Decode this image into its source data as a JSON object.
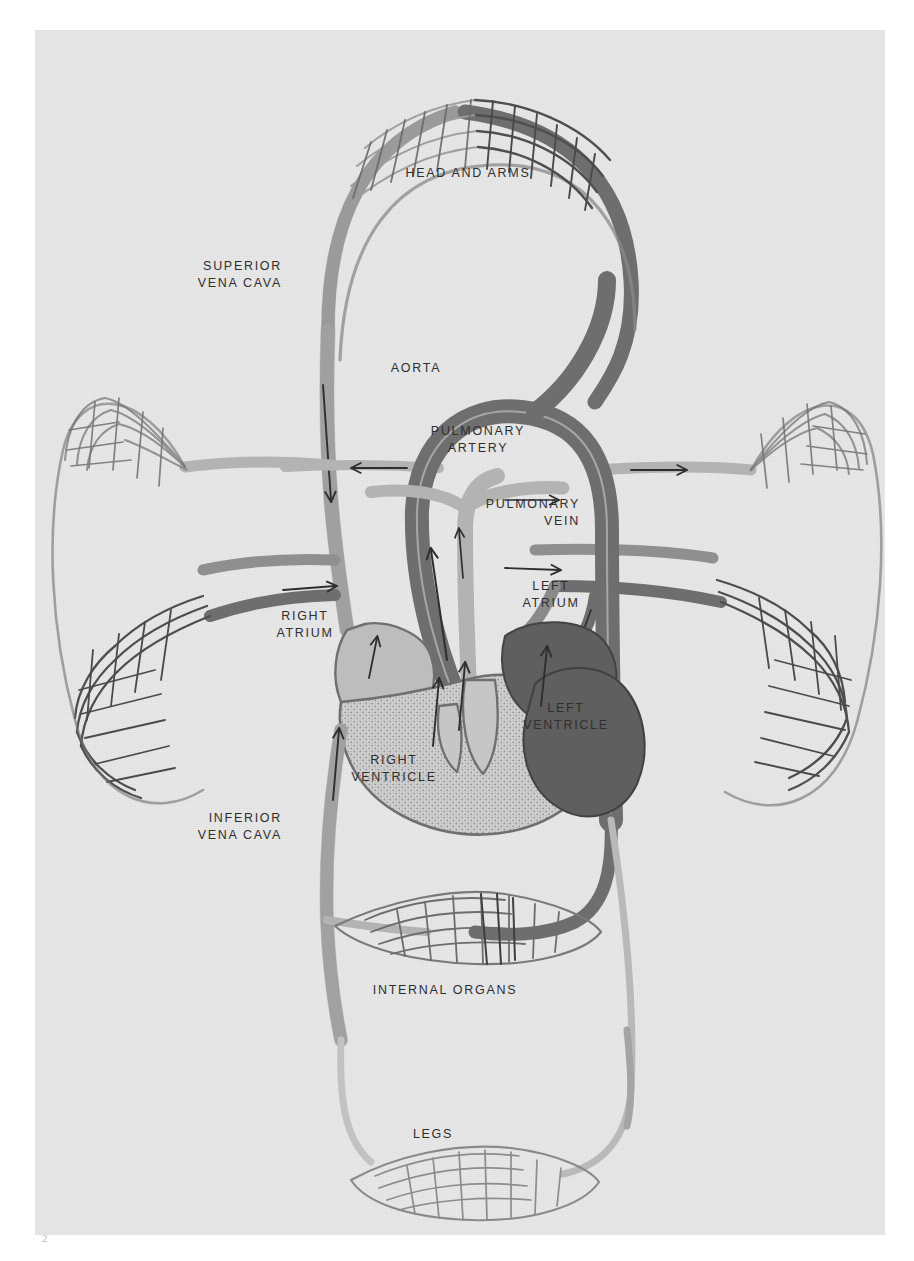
{
  "figure": {
    "page_number": "2",
    "paper_color": "#e9e9e9",
    "ink_dark": "#6b6b6b",
    "ink_light": "#b9b9b9",
    "outline_color": "#555555"
  },
  "labels": {
    "head_and_arms": "HEAD AND ARMS",
    "superior_vena_cava": "SUPERIOR\nVENA CAVA",
    "aorta": "AORTA",
    "pulmonary_artery": "PULMONARY\nARTERY",
    "pulmonary_vein": "PULMONARY\nVEIN",
    "left_atrium": "LEFT\nATRIUM",
    "right_atrium": "RIGHT\nATRIUM",
    "left_ventricle": "LEFT\nVENTRICLE",
    "right_ventricle": "RIGHT\nVENTRICLE",
    "inferior_vena_cava": "INFERIOR\nVENA CAVA",
    "internal_organs": "INTERNAL ORGANS",
    "legs": "LEGS"
  },
  "capillary_beds": [
    {
      "name": "head-and-arms",
      "label": "HEAD AND ARMS"
    },
    {
      "name": "left-lung",
      "label": ""
    },
    {
      "name": "right-lung",
      "label": ""
    },
    {
      "name": "internal-organs",
      "label": "INTERNAL ORGANS"
    },
    {
      "name": "legs",
      "label": "LEGS"
    }
  ],
  "flow_arrows": [
    {
      "name": "superior-vena-cava-down",
      "direction": "down"
    },
    {
      "name": "aorta-arch-up",
      "direction": "up"
    },
    {
      "name": "aorta-to-head-down",
      "direction": "down"
    },
    {
      "name": "left-subclavian-left",
      "direction": "left"
    },
    {
      "name": "right-subclavian-right",
      "direction": "right"
    },
    {
      "name": "pulmonary-artery-left",
      "direction": "left"
    },
    {
      "name": "pulmonary-artery-right",
      "direction": "right"
    },
    {
      "name": "pulmonary-vein-into-left-atrium",
      "direction": "down"
    },
    {
      "name": "right-atrium-inflow-up",
      "direction": "up"
    },
    {
      "name": "right-ventricle-outflow-up",
      "direction": "up"
    },
    {
      "name": "left-ventricle-outflow-up",
      "direction": "up"
    },
    {
      "name": "descending-aorta-down",
      "direction": "down"
    },
    {
      "name": "inferior-vena-cava-up",
      "direction": "up"
    }
  ]
}
